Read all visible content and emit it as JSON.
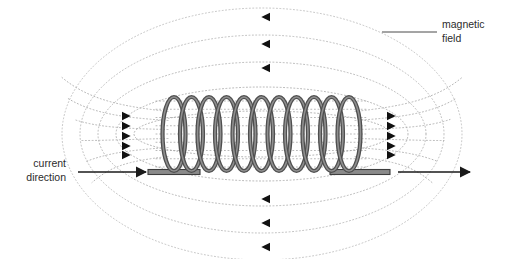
{
  "diagram": {
    "background_color": "#ffffff",
    "labels": {
      "magnetic_field": {
        "line1": "magnetic",
        "line2": "field",
        "align": "left",
        "x": 442,
        "y1": 28,
        "y2": 42,
        "leader_line": {
          "x1": 382,
          "y1": 32,
          "x2": 437,
          "y2": 32,
          "color": "#4a4a4a"
        }
      },
      "current_direction": {
        "line1": "current",
        "line2": "direction",
        "align": "right",
        "x": 66,
        "y1": 167,
        "y2": 181,
        "arrow": {
          "x1": 78,
          "y1": 172,
          "x2": 146,
          "y2": 172,
          "color": "#1a1a1a",
          "direction": "right"
        }
      }
    },
    "coil": {
      "turns": 11,
      "x_start": 174,
      "x_end": 349,
      "center_y": 134,
      "loop_rx": 11.5,
      "loop_ry": 37,
      "stroke_outer": "#4f4f4f",
      "stroke_inner": "#8f8f8f",
      "stroke_width": 4.2
    },
    "lead_wire": {
      "left_x1": 148,
      "left_x2": 200,
      "right_x1": 330,
      "right_x2": 390,
      "y": 172,
      "thickness": 5,
      "fill": "#8a8a8a",
      "stroke": "#3d3d3d"
    },
    "right_current_arrow": {
      "x1": 398,
      "y1": 172,
      "x2": 470,
      "y2": 172,
      "color": "#1a1a1a",
      "direction": "right"
    },
    "field_lines": {
      "style": "dotted",
      "color": "#a9a9a9",
      "stroke_width": 1,
      "dash": "1 2.4",
      "loops": [
        {
          "rx": 128,
          "ry": 23,
          "cx": 262,
          "cy": 134
        },
        {
          "rx": 146,
          "ry": 47,
          "cx": 262,
          "cy": 134
        },
        {
          "rx": 164,
          "ry": 72,
          "cx": 262,
          "cy": 134
        },
        {
          "rx": 182,
          "ry": 99,
          "cx": 262,
          "cy": 134
        },
        {
          "rx": 200,
          "ry": 126,
          "cx": 262,
          "cy": 134
        }
      ],
      "inner_hatch_count": 9
    },
    "arrowheads": {
      "top": {
        "direction": "left",
        "x": 264,
        "ys": [
          17,
          44,
          68
        ]
      },
      "bottom": {
        "direction": "left",
        "x": 264,
        "ys": [
          199,
          223,
          247
        ]
      },
      "left_side": {
        "direction": "right",
        "x": 128,
        "ys": [
          116,
          126,
          136,
          146,
          155
        ]
      },
      "right_side": {
        "direction": "right",
        "x": 393,
        "ys": [
          116,
          126,
          136,
          146,
          155
        ]
      },
      "color": "#111111",
      "size": 6
    }
  }
}
